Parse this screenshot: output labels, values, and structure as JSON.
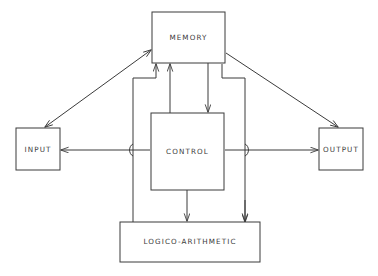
{
  "diagram": {
    "stroke_color": "#3b3b3b",
    "background_color": "#ffffff",
    "blocks": [
      {
        "id": "memory",
        "label": "MEMORY",
        "x": 152,
        "y": 12,
        "w": 73,
        "h": 51
      },
      {
        "id": "input",
        "label": "INPUT",
        "x": 16,
        "y": 128,
        "w": 44,
        "h": 42
      },
      {
        "id": "output",
        "label": "OUTPUT",
        "x": 319,
        "y": 128,
        "w": 44,
        "h": 42
      },
      {
        "id": "control",
        "label": "CONTROL",
        "x": 151,
        "y": 113,
        "w": 73,
        "h": 77
      },
      {
        "id": "logico",
        "label": "LOGICO-ARITHMETIC",
        "x": 120,
        "y": 222,
        "w": 140,
        "h": 40
      }
    ],
    "connections": [
      {
        "id": "input-memory",
        "from": "input",
        "to": "memory",
        "arrows": "both"
      },
      {
        "id": "memory-output",
        "from": "memory",
        "to": "output",
        "arrows": "end"
      },
      {
        "id": "memory-control",
        "from": "memory",
        "to": "control",
        "arrows": "end"
      },
      {
        "id": "control-memory",
        "from": "control",
        "to": "memory",
        "arrows": "end"
      },
      {
        "id": "logico-memory",
        "from": "logico",
        "to": "memory",
        "arrows": "end"
      },
      {
        "id": "control-input",
        "from": "control",
        "to": "input",
        "arrows": "end"
      },
      {
        "id": "control-output",
        "from": "control",
        "to": "output",
        "arrows": "end"
      },
      {
        "id": "control-logico",
        "from": "control",
        "to": "logico",
        "arrows": "end"
      },
      {
        "id": "control-logico-right-bus",
        "from": "control",
        "to": "logico",
        "arrows": "end"
      }
    ]
  }
}
